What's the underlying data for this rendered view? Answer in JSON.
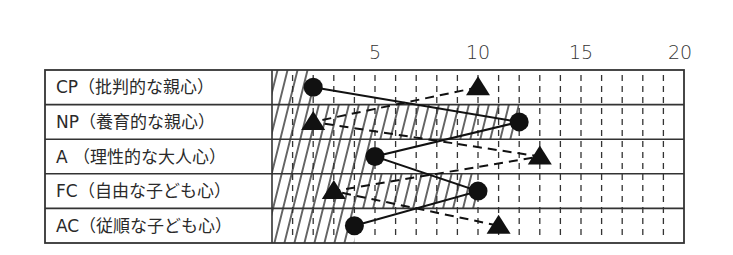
{
  "chart_data": {
    "type": "line",
    "title": "",
    "xlabel": "",
    "ylabel": "",
    "orientation": "horizontal-profile",
    "xlim": [
      0,
      20
    ],
    "x_ticks": [
      5,
      10,
      15,
      20
    ],
    "grid": "dashed vertical at every integer 1-19",
    "categories": [
      "CP（批判的な親心）",
      "NP（養育的な親心）",
      "A （理性的な大人心）",
      "FC（自由な子ども心）",
      "AC（従順な子ども心）"
    ],
    "series": [
      {
        "name": "circle",
        "marker": "circle",
        "line": "solid",
        "hatched_fill": true,
        "values": [
          2,
          12,
          5,
          10,
          4
        ]
      },
      {
        "name": "triangle",
        "marker": "triangle",
        "line": "dashed",
        "hatched_fill": false,
        "values": [
          10,
          2,
          13,
          3,
          11
        ]
      }
    ],
    "legend": "none"
  },
  "colors": {
    "ink": "#111111",
    "border": "#333333",
    "background": "#ffffff"
  }
}
